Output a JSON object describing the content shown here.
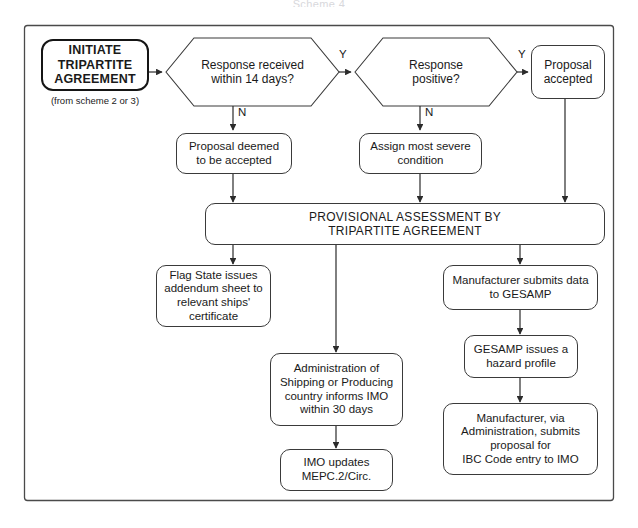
{
  "document": {
    "title": "Scheme 4"
  },
  "frame": {
    "name": "diagram-border"
  },
  "nodes": {
    "initiate": {
      "label": "INITIATE\nTRIPARTITE\nAGREEMENT",
      "sublabel": "(from scheme 2 or 3)"
    },
    "decision_response_received": {
      "label": "Response received\nwithin 14 days?"
    },
    "decision_response_positive": {
      "label": "Response\npositive?"
    },
    "proposal_accepted": {
      "label": "Proposal\naccepted"
    },
    "proposal_deemed_accepted": {
      "label": "Proposal deemed\nto be accepted"
    },
    "assign_severe_condition": {
      "label": "Assign most severe\ncondition"
    },
    "provisional_assessment": {
      "label": "PROVISIONAL ASSESSMENT BY\nTRIPARTITE AGREEMENT"
    },
    "flag_state_addendum": {
      "label": "Flag State issues\naddendum sheet to\nrelevant ships'\ncertificate"
    },
    "administration_informs_imo": {
      "label": "Administration of\nShipping or Producing\ncountry informs IMO\nwithin 30 days"
    },
    "imo_updates_mepc": {
      "label": "IMO updates\nMEPC.2/Circ."
    },
    "manufacturer_submits_data": {
      "label": "Manufacturer submits data\nto GESAMP"
    },
    "gesamp_hazard_profile": {
      "label": "GESAMP issues a\nhazard profile"
    },
    "manufacturer_ibc_proposal": {
      "label": "Manufacturer, via\nAdministration, submits\nproposal for\nIBC Code entry to IMO"
    }
  },
  "edge_labels": {
    "yes_1": "Y",
    "no_1": "N",
    "yes_2": "Y",
    "no_2": "N"
  },
  "colors": {
    "stroke": "#3a3a3a",
    "stroke_strong": "#151515",
    "background": "#ffffff",
    "text": "#1a1a1a"
  }
}
